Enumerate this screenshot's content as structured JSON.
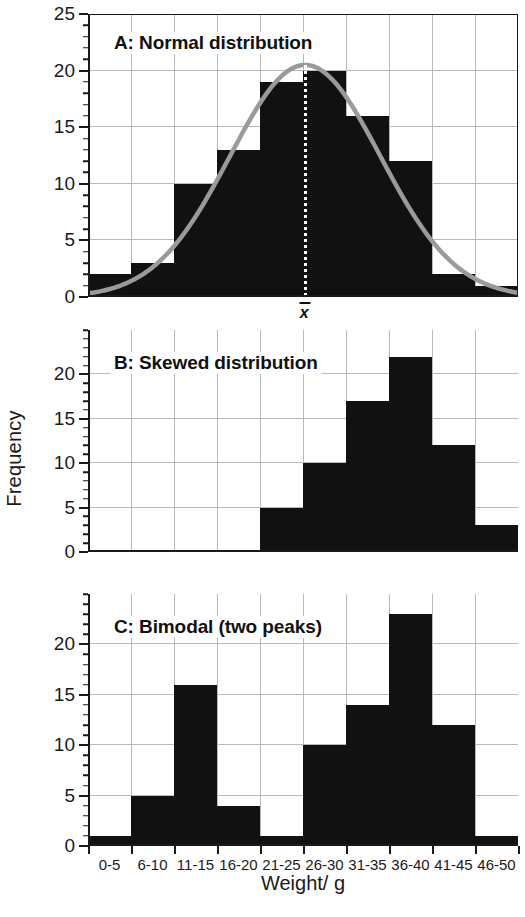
{
  "chart_data": {
    "type": "bar",
    "title": "",
    "xlabel": "Weight/ g",
    "ylabel": "Frequency",
    "categories": [
      "0-5",
      "6-10",
      "11-15",
      "16-20",
      "21-25",
      "26-30",
      "31-35",
      "36-40",
      "41-45",
      "46-50"
    ],
    "grid": true,
    "legend": "none",
    "panels": [
      {
        "id": "A",
        "caption": "A: Normal distribution",
        "ylim": [
          0,
          25
        ],
        "yticks": [
          0,
          5,
          10,
          15,
          20,
          25
        ],
        "ytick_labels": [
          "0",
          "5",
          "10",
          "15",
          "20",
          "25"
        ],
        "values": [
          2,
          3,
          10,
          13,
          19,
          20,
          16,
          12,
          2,
          1
        ],
        "overlay": {
          "kind": "normal-curve",
          "color": "#9a9a9a",
          "peak": 20.5,
          "mean_category": "21-25/26-30 boundary"
        },
        "annotation": {
          "kind": "mean-line",
          "label": "x",
          "label_overbar": true,
          "style": "dotted-white"
        }
      },
      {
        "id": "B",
        "caption": "B: Skewed distribution",
        "ylim": [
          0,
          25
        ],
        "yticks": [
          0,
          5,
          10,
          15,
          20
        ],
        "ytick_labels": [
          "0",
          "5",
          "10",
          "15",
          "20"
        ],
        "values": [
          0,
          0,
          0,
          0,
          5,
          10,
          17,
          22,
          12,
          3
        ]
      },
      {
        "id": "C",
        "caption": "C: Bimodal (two peaks)",
        "ylim": [
          0,
          25
        ],
        "yticks": [
          0,
          5,
          10,
          15,
          20
        ],
        "ytick_labels": [
          "0",
          "5",
          "10",
          "15",
          "20"
        ],
        "values": [
          1,
          5,
          16,
          4,
          1,
          10,
          14,
          23,
          12,
          1
        ]
      }
    ],
    "colors": {
      "bar": "#111111",
      "curve": "#9a9a9a",
      "grid": "#b9b9b9",
      "axis": "#1a1a1a",
      "background": "#ffffff"
    }
  }
}
